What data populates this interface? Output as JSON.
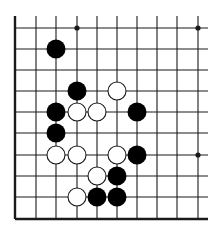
{
  "diagram": {
    "type": "go-board-fragment",
    "background": "#ffffff",
    "line_color": "#1a1a1a",
    "grid": {
      "x": [
        15,
        36,
        56,
        77,
        97,
        117,
        137,
        157,
        177,
        198
      ],
      "y": [
        28,
        49,
        70,
        91,
        112,
        133,
        155,
        176,
        197,
        219
      ],
      "line_top": 16,
      "line_right": 208,
      "left_edge_thick": true,
      "bottom_edge_thick": true
    },
    "star_points": [
      [
        3,
        0
      ],
      [
        9,
        0
      ],
      [
        9,
        6
      ]
    ],
    "black_stones": [
      [
        2,
        1
      ],
      [
        3,
        3
      ],
      [
        2,
        4
      ],
      [
        2,
        5
      ],
      [
        6,
        4
      ],
      [
        6,
        6
      ],
      [
        5,
        7
      ],
      [
        4,
        8
      ],
      [
        5,
        8
      ]
    ],
    "white_stones": [
      [
        5,
        3
      ],
      [
        3,
        4
      ],
      [
        4,
        4
      ],
      [
        2,
        6
      ],
      [
        3,
        6
      ],
      [
        5,
        6
      ],
      [
        4,
        7
      ],
      [
        3,
        8
      ]
    ],
    "stone_radius": 9.5,
    "colors": {
      "black": "#000000",
      "white": "#ffffff"
    }
  }
}
